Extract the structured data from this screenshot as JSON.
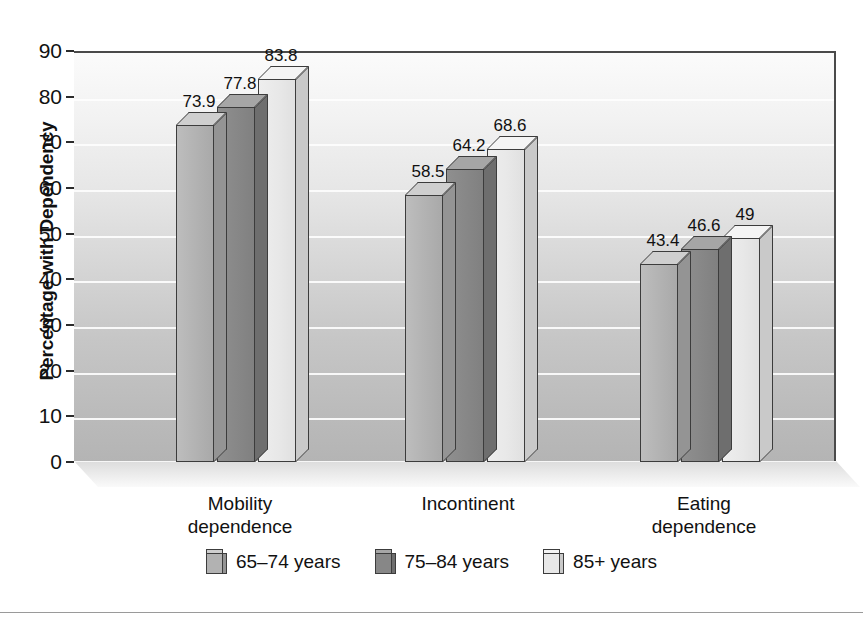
{
  "chart_data": {
    "type": "bar",
    "title": "",
    "subtitle": "",
    "xlabel": "",
    "ylabel": "Percentage with Dependency",
    "ylim": [
      0,
      90
    ],
    "ytick_step": 10,
    "yticks": [
      "90",
      "80",
      "70",
      "60",
      "50",
      "40",
      "30",
      "20",
      "10",
      "0"
    ],
    "grid": true,
    "legend_position": "bottom",
    "style": "3d-bar",
    "categories": [
      "Mobility dependence",
      "Incontinent",
      "Eating dependence"
    ],
    "category_lines": [
      [
        "Mobility",
        "dependence"
      ],
      [
        "Incontinent",
        ""
      ],
      [
        "Eating",
        "dependence"
      ]
    ],
    "series": [
      {
        "name": "65–74 years",
        "values": [
          73.9,
          58.5,
          43.4
        ],
        "labels": [
          "73.9",
          "58.5",
          "43.4"
        ],
        "color": "#b2b2b2"
      },
      {
        "name": "75–84 years",
        "values": [
          77.8,
          64.2,
          46.6
        ],
        "labels": [
          "77.8",
          "64.2",
          "46.6"
        ],
        "color": "#878787"
      },
      {
        "name": "85+ years",
        "values": [
          83.8,
          68.6,
          49.0
        ],
        "labels": [
          "83.8",
          "68.6",
          "49"
        ],
        "color": "#e8e8e8"
      }
    ]
  },
  "axis": {
    "y_title": "Percentage with Dependency"
  },
  "legend": {
    "items": [
      {
        "label": "65–74 years",
        "swatch": "tone-a"
      },
      {
        "label": "75–84 years",
        "swatch": "tone-b"
      },
      {
        "label": "85+ years",
        "swatch": "tone-c"
      }
    ]
  },
  "colors": {
    "series_1": "#b2b2b2",
    "series_2": "#878787",
    "series_3": "#e8e8e8",
    "outline": "#3c3c3c",
    "gridline": "#fdfdfd",
    "text": "#111111"
  }
}
